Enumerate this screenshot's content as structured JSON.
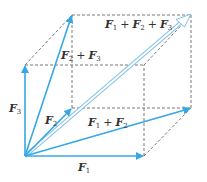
{
  "diagram": {
    "colors": {
      "vector": "#35a8e6",
      "resultant": "#7fbfe8",
      "dashed": "#555555",
      "label": "#333333"
    },
    "points": {
      "origin": [
        25,
        156
      ],
      "F1": [
        144,
        156
      ],
      "F2": [
        72,
        108
      ],
      "F3": [
        25,
        65
      ],
      "F1_plus_F2": [
        191,
        108
      ],
      "F1_plus_F3": [
        144,
        65
      ],
      "F2_plus_F3": [
        72,
        15
      ],
      "F1_plus_F2_plus_F3": [
        191,
        15
      ]
    },
    "labels": {
      "F1": {
        "base": "F",
        "sub": "1"
      },
      "F2": {
        "base": "F",
        "sub": "2"
      },
      "F3": {
        "base": "F",
        "sub": "3"
      },
      "F1_plus_F2": {
        "a": "F",
        "a_sub": "1",
        "op": "+",
        "b": "F",
        "b_sub": "2"
      },
      "F2_plus_F3": {
        "a": "F",
        "a_sub": "2",
        "op": "+",
        "b": "F",
        "b_sub": "3"
      },
      "F1_plus_F2_plus_F3": {
        "a": "F",
        "a_sub": "1",
        "op1": "+",
        "b": "F",
        "b_sub": "2",
        "op2": "+",
        "c": "F",
        "c_sub": "3"
      }
    },
    "vectors": [
      "F1",
      "F2",
      "F3",
      "F1 + F2",
      "F2 + F3",
      "F1 + F2 + F3"
    ]
  }
}
